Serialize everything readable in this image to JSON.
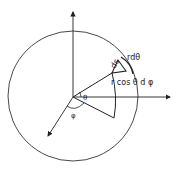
{
  "diagram": {
    "labels": {
      "ds": "ds",
      "r_dtheta": "rdθ",
      "r_cos_theta_dphi": "r cos θ d φ",
      "theta": "θ",
      "phi": "φ"
    },
    "elements": {
      "sphere": "circle",
      "axes": [
        "vertical-axis",
        "horizontal-axis",
        "oblique-axis"
      ],
      "sector": "spherical wedge",
      "surface_patch": "area element ds"
    },
    "colors": {
      "stroke": "#222222",
      "background": "#ffffff"
    }
  }
}
